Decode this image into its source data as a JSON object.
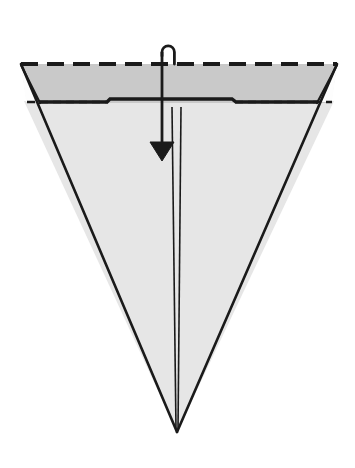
{
  "figure": {
    "canvas": {
      "width": 355,
      "height": 468,
      "background": "#ffffff"
    }
  },
  "colors": {
    "background": "#ffffff",
    "band_fill": "#c9c9c9",
    "body_fill": "#e6e6e6",
    "flap_fill": "#fdfdfd",
    "stroke": "#1a1a1a",
    "stroke_soft": "#2b2b2b"
  },
  "shapes": {
    "top_band": {
      "name": "folded-top-band",
      "fill": "#c9c9c9",
      "points": "21,64 337,64 331,103 27,103"
    },
    "lower_body": {
      "name": "cone-body",
      "fill": "#e6e6e6",
      "points": "24,101 334,101 177,432"
    },
    "left_flap": {
      "name": "left-corner-flap",
      "fill": "#fdfdfd",
      "points": "21,65 39,102 26,102"
    },
    "right_flap": {
      "name": "right-corner-flap",
      "fill": "#fdfdfd",
      "points": "337,65 332,102 318,102"
    }
  },
  "lines": {
    "top_edge_dashed": {
      "name": "top-edge-dashed-fold-line",
      "x1": 21,
      "y1": 64,
      "x2": 337,
      "y2": 64,
      "dash": "17 9",
      "width": 4.2
    },
    "band_bottom_solid": {
      "name": "band-bottom-solid-edge",
      "points": "39,102 107,102 110,99 232,99 236,102 318,102",
      "width": 3.4
    },
    "band_bottom_dashed_left": {
      "name": "band-bottom-dashed-left",
      "x1": 27,
      "y1": 102,
      "x2": 108,
      "y2": 102,
      "dash": "8 5",
      "width": 2.6
    },
    "band_bottom_dashed_right": {
      "name": "band-bottom-dashed-right",
      "x1": 235,
      "y1": 102,
      "x2": 332,
      "y2": 102,
      "dash": "8 5",
      "width": 2.6
    },
    "left_outer_edge": {
      "name": "left-outer-edge",
      "x1": 21,
      "y1": 64,
      "x2": 177,
      "y2": 432,
      "width": 2.6
    },
    "right_outer_edge": {
      "name": "right-outer-edge",
      "x1": 337,
      "y1": 64,
      "x2": 177,
      "y2": 432,
      "width": 2.6
    },
    "left_flap_crease": {
      "name": "left-flap-crease",
      "x1": 21,
      "y1": 65,
      "x2": 40,
      "y2": 103,
      "width": 2.2
    },
    "right_flap_crease": {
      "name": "right-flap-crease",
      "x1": 337,
      "y1": 65,
      "x2": 317,
      "y2": 103,
      "width": 2.2
    },
    "center_line_left": {
      "name": "center-crease-left",
      "x1": 172,
      "y1": 107,
      "x2": 176,
      "y2": 430,
      "width": 1.6
    },
    "center_line_right": {
      "name": "center-crease-right",
      "x1": 181,
      "y1": 107,
      "x2": 178,
      "y2": 430,
      "width": 1.6
    }
  },
  "arrow": {
    "name": "fold-direction-arrow",
    "shaft_x": 162,
    "shaft_top_y": 52,
    "shaft_bottom_y": 152,
    "hook_path": "M 162 56 L 162 52 A 6.2 6.2 0 0 1 174.4 52 L 174.4 64",
    "head_points": "150,142 174,142 162,161",
    "stroke_width": 2.8,
    "label": "fold down"
  }
}
